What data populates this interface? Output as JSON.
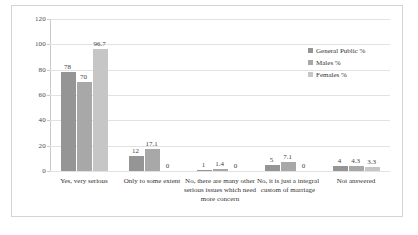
{
  "chart_data": {
    "type": "bar",
    "title": "",
    "subtitle": "",
    "xlabel": "",
    "ylabel": "",
    "ylim": [
      0,
      120
    ],
    "yticks": [
      0,
      20,
      40,
      60,
      80,
      100,
      120
    ],
    "grid": true,
    "legend_position": "right",
    "categories": [
      "Yes, very serious",
      "Only to some extent",
      "No, there are many other serious issues which need more concern",
      "No, it is just a integral custom of marriage",
      "Not answered"
    ],
    "series": [
      {
        "name": "General Public %",
        "color": "#959595",
        "values": [
          78,
          12,
          1,
          5,
          4
        ],
        "labels": [
          "78",
          "12",
          "1",
          "5",
          "4"
        ]
      },
      {
        "name": "Males %",
        "color": "#a8a8a8",
        "values": [
          70,
          17.1,
          1.4,
          7.1,
          4.3
        ],
        "labels": [
          "70",
          "17.1",
          "1.4",
          "7.1",
          "4.3"
        ]
      },
      {
        "name": "Females %",
        "color": "#c6c6c6",
        "values": [
          96.7,
          0,
          0,
          0,
          3.3
        ],
        "labels": [
          "96.7",
          "0",
          "0",
          "0",
          "3.3"
        ]
      }
    ]
  }
}
